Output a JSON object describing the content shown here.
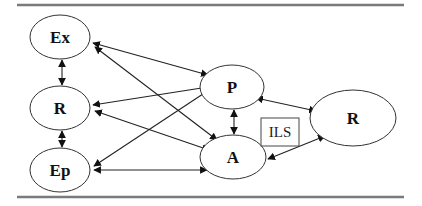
{
  "diagram": {
    "nodes": [
      {
        "id": "Ex",
        "label": "Ex",
        "cx": 60,
        "cy": 37,
        "rx": 30,
        "ry": 22
      },
      {
        "id": "R_left",
        "label": "R",
        "cx": 60,
        "cy": 108,
        "rx": 30,
        "ry": 22
      },
      {
        "id": "Ep",
        "label": "Ep",
        "cx": 60,
        "cy": 170,
        "rx": 30,
        "ry": 22
      },
      {
        "id": "P",
        "label": "P",
        "cx": 232,
        "cy": 87,
        "rx": 32,
        "ry": 22
      },
      {
        "id": "A",
        "label": "A",
        "cx": 233,
        "cy": 157,
        "rx": 33,
        "ry": 22
      },
      {
        "id": "R_right",
        "label": "R",
        "cx": 353,
        "cy": 118,
        "rx": 43,
        "ry": 28
      }
    ],
    "box": {
      "label": "ILS"
    },
    "edges": [
      {
        "from": "Ex",
        "to": "R_left",
        "direction": "bidirectional"
      },
      {
        "from": "R_left",
        "to": "Ep",
        "direction": "bidirectional"
      },
      {
        "from": "Ex",
        "to": "P",
        "direction": "bidirectional"
      },
      {
        "from": "Ex",
        "to": "A",
        "direction": "bidirectional"
      },
      {
        "from": "R_left",
        "to": "P",
        "direction": "bidirectional"
      },
      {
        "from": "R_left",
        "to": "A",
        "direction": "bidirectional"
      },
      {
        "from": "Ep",
        "to": "P",
        "direction": "bidirectional"
      },
      {
        "from": "Ep",
        "to": "A",
        "direction": "bidirectional"
      },
      {
        "from": "P",
        "to": "A",
        "direction": "bidirectional"
      },
      {
        "from": "P",
        "to": "R_right",
        "direction": "bidirectional"
      },
      {
        "from": "A",
        "to": "R_right",
        "direction": "bidirectional"
      }
    ]
  },
  "labels": {
    "ex": "Ex",
    "r_left": "R",
    "ep": "Ep",
    "p": "P",
    "a": "A",
    "r_right": "R",
    "ils": "ILS"
  },
  "colors": {
    "rule": "#7a7a7a",
    "stroke": "#222222",
    "background": "#ffffff"
  }
}
